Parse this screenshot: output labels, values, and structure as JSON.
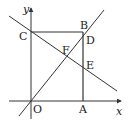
{
  "diagram": {
    "type": "coordinate-geometry",
    "axes": {
      "x_label": "x",
      "y_label": "y",
      "origin_label": "O"
    },
    "points": [
      {
        "label": "O",
        "role": "origin"
      },
      {
        "label": "A",
        "role": "rectangle vertex on x-axis"
      },
      {
        "label": "B",
        "role": "rectangle top-right vertex"
      },
      {
        "label": "C",
        "role": "rectangle vertex on y-axis"
      },
      {
        "label": "D",
        "role": "intersection of line through O with segment AB"
      },
      {
        "label": "E",
        "role": "intersection of line through C with segment AB"
      },
      {
        "label": "F",
        "role": "intersection of the two lines"
      }
    ],
    "shapes": [
      {
        "kind": "rectangle",
        "vertices": [
          "O",
          "A",
          "B",
          "C"
        ]
      },
      {
        "kind": "line",
        "through": [
          "O",
          "F",
          "D"
        ],
        "slope": "positive"
      },
      {
        "kind": "line",
        "through": [
          "C",
          "F",
          "E"
        ],
        "slope": "negative"
      }
    ],
    "labels": {
      "O": "O",
      "A": "A",
      "B": "B",
      "C": "C",
      "D": "D",
      "E": "E",
      "F": "F",
      "x": "x",
      "y": "y"
    }
  }
}
